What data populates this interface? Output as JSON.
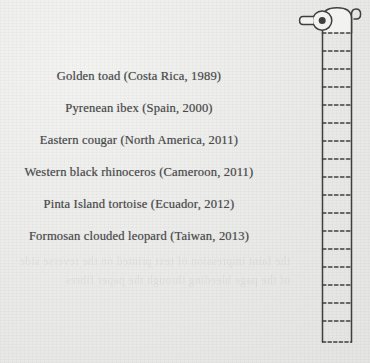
{
  "page": {
    "background_color": "#ecece9",
    "ink_color": "#4a4a4c",
    "showthrough_text": "the faint impression of text printed on the reverse side of the page bleeding through the paper fibres"
  },
  "species_list": {
    "entries": [
      {
        "label": "Golden toad (Costa Rica, 1989)",
        "name": "Golden toad",
        "place": "Costa Rica",
        "year": 1989
      },
      {
        "label": "Pyrenean ibex (Spain, 2000)",
        "name": "Pyrenean ibex",
        "place": "Spain",
        "year": 2000
      },
      {
        "label": "Eastern cougar (North America, 2011)",
        "name": "Eastern cougar",
        "place": "North America",
        "year": 2011
      },
      {
        "label": "Western black rhinoceros (Cameroon, 2011)",
        "name": "Western black rhinoceros",
        "place": "Cameroon",
        "year": 2011
      },
      {
        "label": "Pinta Island tortoise (Ecuador, 2012)",
        "name": "Pinta Island tortoise",
        "place": "Ecuador",
        "year": 2012
      },
      {
        "label": "Formosan clouded leopard (Taiwan, 2013)",
        "name": "Formosan clouded leopard",
        "place": "Taiwan",
        "year": 2013
      }
    ]
  },
  "illustration": {
    "name": "toilet-paper-roll",
    "stroke_color": "#3f3f41",
    "fill_color": "#f2f2f0",
    "parts": {
      "spindle": "spindle-knob",
      "bracket": "wall-bracket-hook",
      "roll": "paper-roll-body",
      "sheet": "hanging-paper-strip"
    },
    "perforation_count": 17
  }
}
